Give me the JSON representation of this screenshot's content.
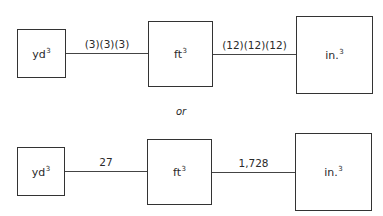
{
  "rows": [
    {
      "boxes": [
        {
          "unit": "yd",
          "exp": "3"
        },
        {
          "unit": "ft",
          "exp": "3"
        },
        {
          "unit": "in.",
          "exp": "3"
        }
      ],
      "connectors": [
        "(3)(3)(3)",
        "(12)(12)(12)"
      ]
    },
    {
      "boxes": [
        {
          "unit": "yd",
          "exp": "3"
        },
        {
          "unit": "ft",
          "exp": "3"
        },
        {
          "unit": "in.",
          "exp": "3"
        }
      ],
      "connectors": [
        "27",
        "1,728"
      ]
    }
  ],
  "separator": "or"
}
